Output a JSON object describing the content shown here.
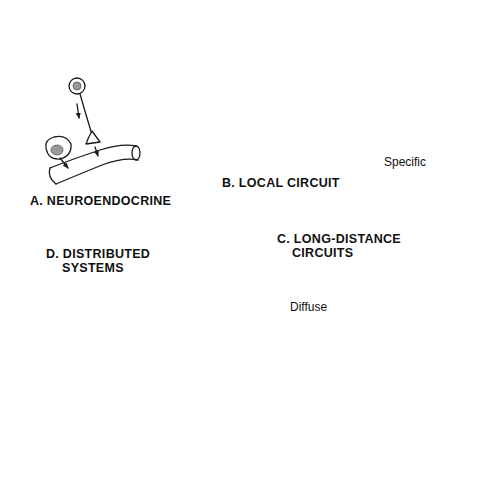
{
  "panels": {
    "a": {
      "label": "A. NEUROENDOCRINE"
    },
    "b": {
      "label": "B. LOCAL CIRCUIT"
    },
    "c": {
      "label_line1": "C. LONG-DISTANCE",
      "label_line2": "CIRCUITS",
      "specific_label": "Specific",
      "diffuse_label": "Diffuse"
    },
    "d": {
      "label_line1": "D. DISTRIBUTED",
      "label_line2": "SYSTEMS"
    }
  },
  "colors": {
    "line": "#1a1a1a",
    "nucleus": "#9a9a9a",
    "background": "#ffffff"
  }
}
